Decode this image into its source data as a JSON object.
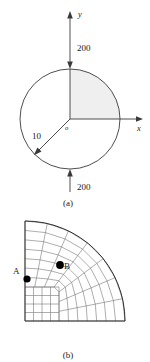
{
  "figure": {
    "background": "#ffffff",
    "stroke": "#3a3a3a",
    "mesh_stroke": "#6b6b6b",
    "shade_color": "#efefef",
    "point_color": "#000000"
  },
  "panel_a": {
    "caption": "(a)",
    "axis_y_label": "y",
    "axis_x_label": "x",
    "origin_label": "o",
    "radius_label": "10",
    "load_top_label": "200",
    "load_bottom_label": "200",
    "circle": {
      "cx": 70,
      "cy": 119,
      "r": 50
    },
    "shaded_quadrant": "upper-right",
    "radius_arrow_angle_deg": 225,
    "arrows": [
      {
        "name": "top-load-arrow",
        "label": "200",
        "direction": "down"
      },
      {
        "name": "bottom-load-arrow",
        "label": "200",
        "direction": "up"
      },
      {
        "name": "y-axis-arrow",
        "direction": "up"
      },
      {
        "name": "x-axis-arrow",
        "direction": "right"
      },
      {
        "name": "radius-arrow",
        "direction": "down-left"
      }
    ]
  },
  "panel_b": {
    "caption": "(b)",
    "point_a_label": "A",
    "point_b_label": "B",
    "mesh": {
      "origin_x": 25,
      "origin_y": 321,
      "radius": 100,
      "type": "o-grid-quarter-disc",
      "inner_block_frac": 0.34,
      "radial_divisions": 7,
      "circumferential_divisions": 7
    },
    "point_a": {
      "x": 27,
      "y": 279
    },
    "point_b": {
      "x": 60,
      "y": 265
    }
  }
}
